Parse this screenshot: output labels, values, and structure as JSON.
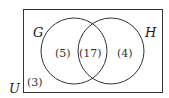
{
  "diagram": {
    "type": "venn",
    "universe": {
      "label": "U",
      "outside_count": "(3)"
    },
    "sets": [
      {
        "label": "G",
        "only_count": "(5)"
      },
      {
        "label": "H",
        "only_count": "(4)"
      }
    ],
    "intersection_count": "(17)",
    "colors": {
      "stroke": "#333333",
      "background": "#ffffff"
    }
  }
}
